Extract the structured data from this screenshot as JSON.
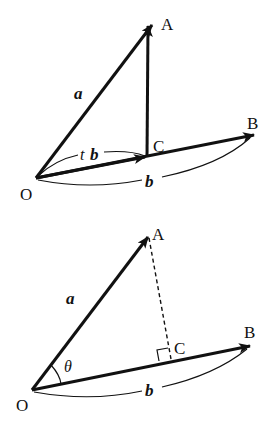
{
  "figure1": {
    "points": {
      "O": {
        "label": "O"
      },
      "A": {
        "label": "A"
      },
      "B": {
        "label": "B"
      },
      "C": {
        "label": "C"
      }
    },
    "vector_a": "a",
    "vector_b": "b",
    "tb_scalar": "t",
    "tb_vector": "b"
  },
  "figure2": {
    "points": {
      "O": {
        "label": "O"
      },
      "A": {
        "label": "A"
      },
      "B": {
        "label": "B"
      },
      "C": {
        "label": "C"
      }
    },
    "vector_a": "a",
    "vector_b": "b",
    "angle": "θ"
  },
  "colors": {
    "stroke": "#111111",
    "background": "#ffffff"
  }
}
